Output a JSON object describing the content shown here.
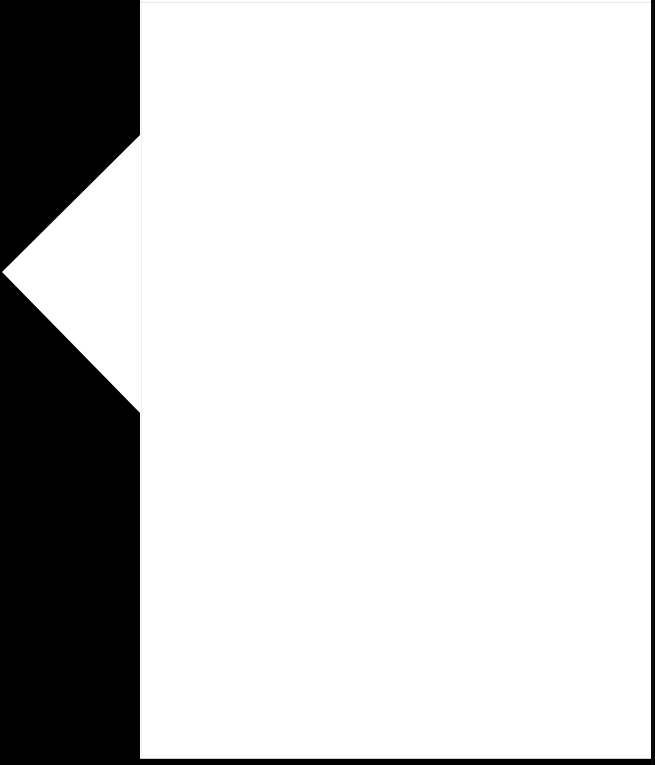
{
  "screen": {
    "width": 655,
    "height": 765,
    "background_color": "#000000"
  },
  "callout": {
    "name": "callout-panel",
    "shape": "popover-with-left-arrow",
    "background_color": "#ffffff",
    "content_text": "",
    "panel": {
      "left": 140,
      "top": 0,
      "width": 511,
      "height": 759
    },
    "arrow": {
      "direction": "left",
      "apex": {
        "x": 2,
        "y": 272
      },
      "top_vertex": {
        "x": 140,
        "y": 133
      },
      "bottom_vertex": {
        "x": 140,
        "y": 415
      }
    },
    "edges": {
      "top_rule_color": "#d8d8d8",
      "bottom_rule_color": "#bfbfbf",
      "right_edge_color": "#0a0a0a",
      "seam_color": "#ededed"
    }
  }
}
